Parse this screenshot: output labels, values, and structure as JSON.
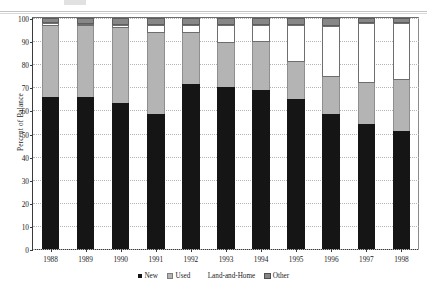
{
  "chart_data": {
    "type": "bar",
    "subtype": "stacked-100-percent",
    "title": "",
    "xlabel": "",
    "ylabel": "Percent of Balance",
    "ylim": [
      0,
      100
    ],
    "yticks": [
      0,
      10,
      20,
      30,
      40,
      50,
      60,
      70,
      80,
      90,
      100
    ],
    "grid": true,
    "legend_position": "bottom",
    "categories": [
      "1988",
      "1989",
      "1990",
      "1991",
      "1992",
      "1993",
      "1994",
      "1995",
      "1996",
      "1997",
      "1998"
    ],
    "series": [
      {
        "name": "New",
        "color": "#151515",
        "values": [
          66,
          66,
          63,
          58.5,
          71.5,
          70,
          69,
          65,
          58.5,
          54,
          51
        ]
      },
      {
        "name": "Used",
        "color": "#b4b4b4",
        "values": [
          30.5,
          30.5,
          32.5,
          35,
          22,
          19,
          20.5,
          16,
          16,
          18,
          22
        ]
      },
      {
        "name": "Land-and-Home",
        "color": "#ffffff",
        "values": [
          1.5,
          1,
          1.5,
          3.5,
          3.5,
          8,
          7.5,
          16,
          22,
          26,
          25
        ]
      },
      {
        "name": "Other",
        "color": "#878787",
        "values": [
          2,
          2.5,
          3,
          3,
          3,
          3,
          3,
          3,
          3.5,
          2,
          2
        ]
      }
    ]
  },
  "legend": {
    "items": [
      {
        "label": "New"
      },
      {
        "label": "Used"
      },
      {
        "label": "Land-and-Home"
      },
      {
        "label": "Other"
      }
    ]
  }
}
